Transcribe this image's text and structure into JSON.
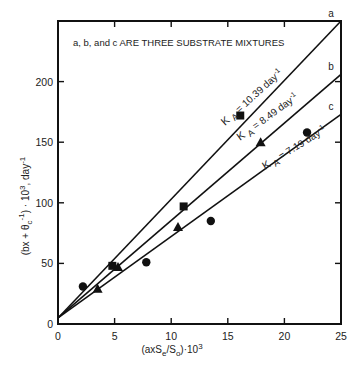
{
  "chart_data": {
    "type": "scatter",
    "title": "",
    "annotation": "a, b, and c ARE THREE SUBSTRATE MIXTURES",
    "xlabel": "(axSe/So)·10^3",
    "xlabel_parts": {
      "pre": "(axS",
      "sub1": "e",
      "mid": "/S",
      "sub2": "o",
      "post": ")·10",
      "sup": "3"
    },
    "ylabel": "(bx + θc^-1) · 10^3 , day^-1",
    "ylabel_parts": {
      "pre": "(bx + θ",
      "sub": "c",
      "sup1": "-1",
      "post": ") · 10",
      "sup2": "3",
      "tail": ", day",
      "sup3": "-1"
    },
    "xlim": [
      0,
      25
    ],
    "ylim": [
      0,
      250
    ],
    "xticks": [
      0,
      5,
      10,
      15,
      20,
      25
    ],
    "yticks": [
      0,
      50,
      100,
      150,
      200
    ],
    "xtick_labels": [
      "0",
      "5",
      "10",
      "15",
      "20",
      "25"
    ],
    "ytick_labels": [
      "0",
      "50",
      "100",
      "150",
      "200"
    ],
    "grid": false,
    "legend": "none",
    "series": [
      {
        "name": "a",
        "marker": "square",
        "k_label": "K",
        "k_sub": "A",
        "k_value": "= 10.39 day",
        "k_sup": "-1",
        "fit_line": {
          "x": [
            0,
            25
          ],
          "y": [
            5,
            250
          ]
        },
        "points": [
          [
            4.8,
            48
          ],
          [
            11.1,
            97
          ],
          [
            16.1,
            172
          ]
        ]
      },
      {
        "name": "b",
        "marker": "triangle",
        "k_label": "K",
        "k_sub": "A",
        "k_value": "= 8.49 day",
        "k_sup": "-1",
        "fit_line": {
          "x": [
            0,
            25
          ],
          "y": [
            5,
            206
          ]
        },
        "points": [
          [
            3.5,
            29
          ],
          [
            5.3,
            47
          ],
          [
            10.6,
            80
          ],
          [
            17.9,
            150
          ]
        ]
      },
      {
        "name": "c",
        "marker": "circle",
        "k_label": "K",
        "k_sub": "A",
        "k_value": "= 7.19 day",
        "k_sup": "-1",
        "fit_line": {
          "x": [
            0,
            25
          ],
          "y": [
            5,
            173
          ]
        },
        "points": [
          [
            2.2,
            31
          ],
          [
            7.8,
            51
          ],
          [
            13.5,
            85
          ],
          [
            22.0,
            158
          ]
        ]
      }
    ]
  }
}
